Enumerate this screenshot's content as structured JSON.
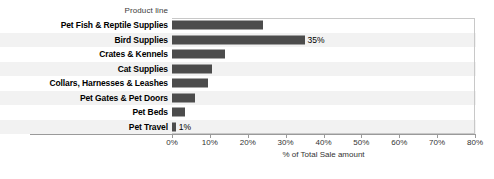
{
  "chart_data": {
    "type": "bar",
    "orientation": "horizontal",
    "title": "",
    "column_header": "Product line",
    "xlabel": "% of Total Sale amount",
    "ylabel": "",
    "xlim": [
      0,
      80
    ],
    "xtick_labels": [
      "0%",
      "10%",
      "20%",
      "30%",
      "40%",
      "50%",
      "60%",
      "70%",
      "80%"
    ],
    "xtick_values": [
      0,
      10,
      20,
      30,
      40,
      50,
      60,
      70,
      80
    ],
    "grid": false,
    "legend": "none",
    "bar_color": "#4c4c4c",
    "band_color": "#f2f2f2",
    "categories": [
      "Pet Fish & Reptile Supplies",
      "Bird Supplies",
      "Crates & Kennels",
      "Cat Supplies",
      "Collars, Harnesses & Leashes",
      "Pet Gates & Pet Doors",
      "Pet Beds",
      "Pet Travel"
    ],
    "values": [
      24,
      35,
      14,
      10.5,
      9.5,
      6,
      3.5,
      1
    ],
    "value_labels": [
      "",
      "35%",
      "",
      "",
      "",
      "",
      "",
      "1%"
    ],
    "rows": [
      {
        "label": "Pet Fish & Reptile Supplies",
        "value": 24,
        "value_label": "",
        "banded": false
      },
      {
        "label": "Bird Supplies",
        "value": 35,
        "value_label": "35%",
        "banded": true
      },
      {
        "label": "Crates & Kennels",
        "value": 14,
        "value_label": "",
        "banded": false
      },
      {
        "label": "Cat Supplies",
        "value": 10.5,
        "value_label": "",
        "banded": true
      },
      {
        "label": "Collars, Harnesses & Leashes",
        "value": 9.5,
        "value_label": "",
        "banded": false
      },
      {
        "label": "Pet Gates & Pet Doors",
        "value": 6,
        "value_label": "",
        "banded": true
      },
      {
        "label": "Pet Beds",
        "value": 3.5,
        "value_label": "",
        "banded": false
      },
      {
        "label": "Pet Travel",
        "value": 1,
        "value_label": "1%",
        "banded": true
      }
    ]
  }
}
